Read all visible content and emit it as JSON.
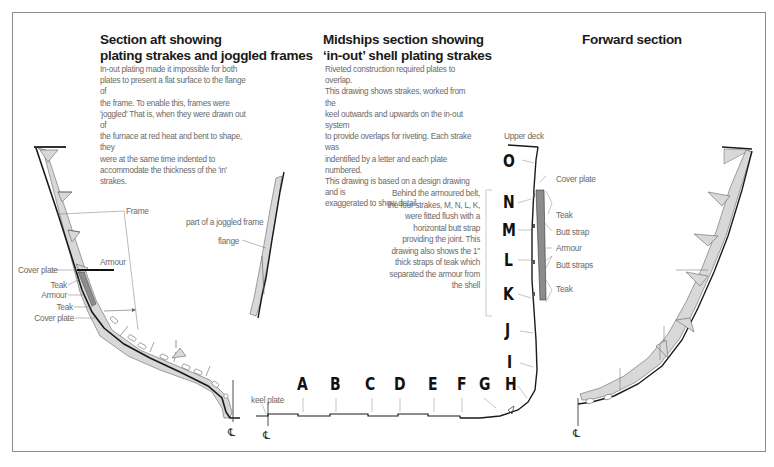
{
  "sections": {
    "aft": {
      "title_line1": "Section aft showing",
      "title_line2": "plating strakes and joggled frames",
      "body": [
        "In-out plating made it impossible for both",
        "plates to present a flat surface to the flange of",
        "the frame.  To enable this, frames were",
        "'joggled' That is, when they were drawn out of",
        "the furnace at red heat and bent to shape, they",
        "were at the same time indented to",
        "accommodate the thickness of the 'in' strakes."
      ],
      "labels": {
        "frame": "Frame",
        "armour_top": "Armour",
        "cover_plate_1": "Cover plate",
        "teak_1": "Teak",
        "armour_2": "Armour",
        "teak_2": "Teak",
        "cover_plate_2": "Cover plate",
        "centreline": "℄"
      }
    },
    "joggled_detail": {
      "caption": "part of a joggled frame",
      "flange": "flange"
    },
    "midships": {
      "title_line1": "Midships section showing",
      "title_line2": "‘in-out’ shell plating strakes",
      "body": [
        "Riveted construction required plates to overlap.",
        "This drawing shows strakes, worked from the",
        "keel outwards and upwards on the in-out system",
        "to provide overlaps for riveting. Each strake was",
        "indentified by a letter and each plate numbered.",
        "This drawing is based on a design drawing and is",
        "exaggerated to show detail."
      ],
      "upper_deck": "Upper deck",
      "keel_plate": "keel plate",
      "centreline": "℄",
      "strakes": [
        "O",
        "N",
        "M",
        "L",
        "K",
        "J",
        "I",
        "H",
        "G",
        "F",
        "E",
        "D",
        "C",
        "B",
        "A"
      ],
      "belt_note": [
        "Behind the armoured belt,",
        "the four strakes, M, N, L, K,",
        "were fitted flush with a",
        "horizontal butt strap",
        "providing the joint.  This",
        "drawing also shows the 1\"",
        "thick straps of teak which",
        "separated the armour from",
        "the shell"
      ],
      "belt_labels": {
        "cover_plate": "Cover plate",
        "teak_upper": "Teak",
        "butt_strap": "Butt strap",
        "armour": "Armour",
        "butt_straps": "Butt straps",
        "teak_lower": "Teak"
      }
    },
    "forward": {
      "title": "Forward section",
      "centreline": "℄"
    }
  },
  "colors": {
    "border": "#8a8a8a",
    "heading": "#1a1a1a",
    "body_text": "#6a6a6a",
    "hull_line": "#1a1a1a",
    "frame_fill": "#d6d6d6",
    "armour_fill": "#8c8c8c"
  }
}
